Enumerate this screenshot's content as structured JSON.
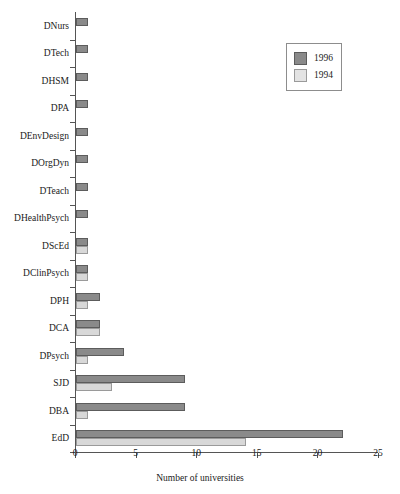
{
  "chart_data": {
    "type": "bar",
    "orientation": "horizontal",
    "title": "",
    "xlabel": "Number of universities",
    "ylabel": "",
    "xlim": [
      0,
      25
    ],
    "xticks": [
      0,
      5,
      10,
      15,
      20,
      25
    ],
    "grid": false,
    "legend": {
      "position": "top-right",
      "entries": [
        {
          "name": "1996",
          "color": "#8a8a8a"
        },
        {
          "name": "1994",
          "color": "#d8d8d8"
        }
      ]
    },
    "categories": [
      "DNurs",
      "DTech",
      "DHSM",
      "DPA",
      "DEnvDesign",
      "DOrgDyn",
      "DTeach",
      "DHealthPsych",
      "DScEd",
      "DClinPsych",
      "DPH",
      "DCA",
      "DPsych",
      "SJD",
      "DBA",
      "EdD"
    ],
    "series": [
      {
        "name": "1996",
        "color": "#8a8a8a",
        "values": [
          1,
          1,
          1,
          1,
          1,
          1,
          1,
          1,
          1,
          1,
          2,
          2,
          4,
          9,
          9,
          22
        ]
      },
      {
        "name": "1994",
        "color": "#d8d8d8",
        "values": [
          0,
          0,
          0,
          0,
          0,
          0,
          0,
          0,
          1,
          1,
          1,
          2,
          1,
          3,
          1,
          14
        ]
      }
    ]
  }
}
